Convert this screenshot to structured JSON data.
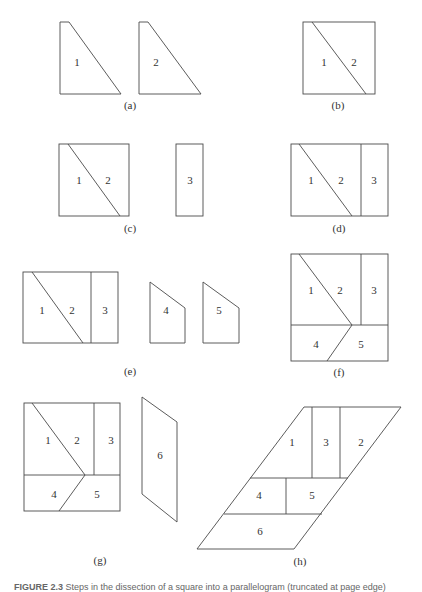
{
  "figure": {
    "panels": [
      {
        "id": "a",
        "label": "(a)",
        "pieces": [
          "1",
          "2"
        ]
      },
      {
        "id": "b",
        "label": "(b)",
        "pieces": [
          "1",
          "2"
        ]
      },
      {
        "id": "c",
        "label": "(c)",
        "pieces": [
          "1",
          "2",
          "3"
        ]
      },
      {
        "id": "d",
        "label": "(d)",
        "pieces": [
          "1",
          "2",
          "3"
        ]
      },
      {
        "id": "e",
        "label": "(e)",
        "pieces": [
          "1",
          "2",
          "3",
          "4",
          "5"
        ]
      },
      {
        "id": "f",
        "label": "(f)",
        "pieces": [
          "1",
          "2",
          "3",
          "4",
          "5"
        ]
      },
      {
        "id": "g",
        "label": "(g)",
        "pieces": [
          "1",
          "2",
          "3",
          "4",
          "5",
          "6"
        ]
      },
      {
        "id": "h",
        "label": "(h)",
        "pieces": [
          "1",
          "3",
          "2",
          "4",
          "5",
          "6"
        ]
      }
    ],
    "caption": {
      "prefix": "FIGURE 2.3",
      "text": "Steps in the dissection of a square into a parallelogram (truncated at page edge)"
    },
    "colors": {
      "stroke": "#4a4a4a",
      "text": "#333333",
      "background": "#ffffff"
    }
  }
}
